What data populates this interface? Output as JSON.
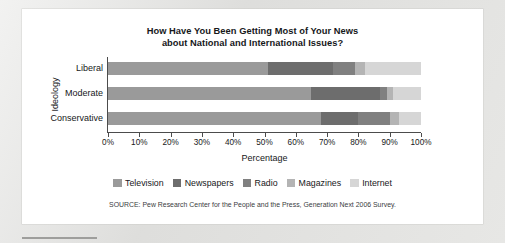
{
  "chart_data": {
    "type": "bar",
    "orientation": "horizontal",
    "stacked": true,
    "normalized": true,
    "title": "How Have You Been Getting Most of Your News about National and International Issues?",
    "title_line1": "How Have You Been Getting Most of Your News",
    "title_line2": "about National and International Issues?",
    "xlabel": "Percentage",
    "ylabel": "Ideology",
    "categories": [
      "Liberal",
      "Moderate",
      "Conservative"
    ],
    "xlim": [
      0,
      100
    ],
    "xticks": [
      0,
      10,
      20,
      30,
      40,
      50,
      60,
      70,
      80,
      90,
      100
    ],
    "xtick_labels": [
      "0%",
      "10%",
      "20%",
      "30%",
      "40%",
      "50%",
      "60%",
      "70%",
      "80%",
      "90%",
      "100%"
    ],
    "grid": false,
    "legend_position": "bottom",
    "series": [
      {
        "name": "Television",
        "color": "#9a9a9a",
        "values": [
          51,
          65,
          68
        ]
      },
      {
        "name": "Newspapers",
        "color": "#6d6d6d",
        "values": [
          21,
          22,
          12
        ]
      },
      {
        "name": "Radio",
        "color": "#808080",
        "values": [
          7,
          2,
          10
        ]
      },
      {
        "name": "Magazines",
        "color": "#b4b4b4",
        "values": [
          3,
          2,
          3
        ]
      },
      {
        "name": "Internet",
        "color": "#d6d6d6",
        "values": [
          18,
          9,
          7
        ]
      }
    ],
    "source": "SOURCE: Pew Research Center for the People and the Press, Generation Next 2006 Survey."
  },
  "legend": [
    {
      "label": "Television",
      "swatch": "#9a9a9a"
    },
    {
      "label": "Newspapers",
      "swatch": "#6d6d6d"
    },
    {
      "label": "Radio",
      "swatch": "#808080"
    },
    {
      "label": "Magazines",
      "swatch": "#b4b4b4"
    },
    {
      "label": "Internet",
      "swatch": "#d6d6d6"
    }
  ]
}
